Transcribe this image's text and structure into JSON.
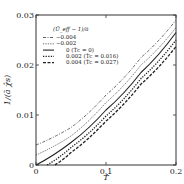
{
  "chart_data": {
    "type": "line",
    "title": "",
    "xlabel": "T̂",
    "ylabel": "1/(ā χ̂s)",
    "xlim": [
      0,
      0.2
    ],
    "ylim": [
      0,
      0.03
    ],
    "xticks": [
      "0",
      "0.1",
      "0.2"
    ],
    "yticks": [
      "0",
      "0.01",
      "0.02",
      "0.03"
    ],
    "legend_title": "(Ū_eff − 1)/ā",
    "legend_position": "upper left",
    "grid": false,
    "series": [
      {
        "name": "−0.004",
        "style": "dash-dot",
        "x": [
          0,
          0.05,
          0.1,
          0.15,
          0.2
        ],
        "y": [
          0.004,
          0.0075,
          0.014,
          0.0215,
          0.029
        ]
      },
      {
        "name": "−0.002",
        "style": "dotted-fine",
        "x": [
          0,
          0.05,
          0.1,
          0.15,
          0.2
        ],
        "y": [
          0.002,
          0.0058,
          0.0125,
          0.02,
          0.0275
        ]
      },
      {
        "name": "0 (T̂c = 0)",
        "style": "solid",
        "x": [
          0,
          0.05,
          0.1,
          0.15,
          0.2
        ],
        "y": [
          0.0,
          0.0045,
          0.011,
          0.0185,
          0.0265
        ]
      },
      {
        "name": "0.002 (T̂c = 0.016)",
        "style": "dotted-bold",
        "x": [
          0.016,
          0.05,
          0.1,
          0.15,
          0.2
        ],
        "y": [
          0.0,
          0.0035,
          0.0098,
          0.0173,
          0.025
        ]
      },
      {
        "name": "0.004 (T̂c = 0.027)",
        "style": "dashed-bold",
        "x": [
          0.027,
          0.05,
          0.1,
          0.15,
          0.2
        ],
        "y": [
          0.0,
          0.0025,
          0.0088,
          0.0162,
          0.0237
        ]
      }
    ]
  }
}
